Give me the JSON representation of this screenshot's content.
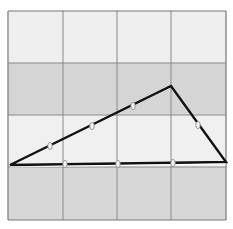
{
  "diagram": {
    "type": "triangle-on-grid",
    "grid": {
      "columns": 4,
      "rows": 4,
      "x_lines": [
        8,
        63,
        117,
        171,
        226
      ],
      "y_lines": [
        11,
        63,
        115,
        167,
        220
      ],
      "row_fills": [
        "#efefef",
        "#d5d5d5",
        "#f0f0f0",
        "#d7d7d7"
      ],
      "line_color": "#8a8a8a",
      "border_color": "#777777"
    },
    "triangle": {
      "vertices": [
        {
          "name": "A",
          "x": 10,
          "y": 165
        },
        {
          "name": "B",
          "x": 171,
          "y": 86
        },
        {
          "name": "C",
          "x": 226,
          "y": 162
        }
      ],
      "stroke": "#111111",
      "stroke_width": 2.4
    },
    "markers": {
      "fill": "#f4f4f4",
      "stroke": "#8a8a8a",
      "points": [
        {
          "side": "AB",
          "x": 50,
          "y": 146
        },
        {
          "side": "AB",
          "x": 92,
          "y": 126
        },
        {
          "side": "AB",
          "x": 133,
          "y": 106
        },
        {
          "side": "BC",
          "x": 198,
          "y": 125
        },
        {
          "side": "AC",
          "x": 65,
          "y": 164
        },
        {
          "side": "AC",
          "x": 118,
          "y": 164
        },
        {
          "side": "AC",
          "x": 173,
          "y": 163
        }
      ]
    }
  }
}
